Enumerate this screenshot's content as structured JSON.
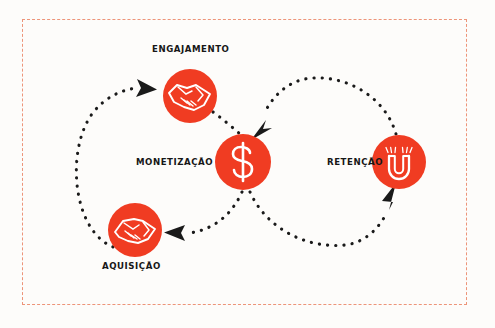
{
  "diagram": {
    "frame_color": "#e8724e",
    "background_color": "#fdfcfa",
    "accent_color": "#f03c22",
    "arrow_color": "#1a1a1a",
    "nodes": [
      {
        "id": "engajamento",
        "label": "ENGAJAMENTO",
        "icon": "handshake-icon",
        "cx": 190,
        "cy": 96,
        "r": 27
      },
      {
        "id": "monetizacao",
        "label": "MONETIZAÇÃO",
        "icon": "dollar-icon",
        "cx": 243,
        "cy": 162,
        "r": 28
      },
      {
        "id": "aquisicao",
        "label": "AQUISIÇÃO",
        "icon": "handshake-icon",
        "cx": 135,
        "cy": 230,
        "r": 27
      },
      {
        "id": "retencao",
        "label": "RETENÇÃO",
        "icon": "magnet-icon",
        "cx": 399,
        "cy": 162,
        "r": 27
      }
    ],
    "connectors": [
      {
        "id": "aquisicao-to-engajamento",
        "from": "aquisicao",
        "to": "engajamento",
        "style": "dotted-arc"
      },
      {
        "id": "engajamento-to-monetizacao",
        "from": "engajamento",
        "to": "monetizacao",
        "style": "dotted-arc"
      },
      {
        "id": "monetizacao-to-aquisicao",
        "from": "monetizacao",
        "to": "aquisicao",
        "style": "dotted-arc"
      },
      {
        "id": "monetizacao-to-retencao",
        "from": "monetizacao",
        "to": "retencao",
        "style": "dotted-arc"
      },
      {
        "id": "retencao-to-monetizacao",
        "from": "retencao",
        "to": "monetizacao",
        "style": "dotted-arc"
      }
    ]
  }
}
